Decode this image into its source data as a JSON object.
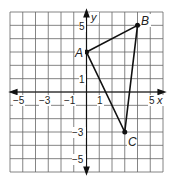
{
  "chart_data": {
    "type": "scatter",
    "title": "",
    "xlabel": "x",
    "ylabel": "y",
    "xlim": [
      -6,
      6
    ],
    "ylim": [
      -6,
      6
    ],
    "grid": true,
    "x_tick_labels": [
      "-5",
      "-3",
      "-1",
      "1",
      "5"
    ],
    "x_tick_values": [
      -5,
      -3,
      -1,
      1,
      5
    ],
    "y_tick_labels": [
      "5",
      "1",
      "-3",
      "-5"
    ],
    "y_tick_values": [
      5,
      1,
      -3,
      -5
    ],
    "points": [
      {
        "label": "A",
        "x": 0,
        "y": 3
      },
      {
        "label": "B",
        "x": 4,
        "y": 5
      },
      {
        "label": "C",
        "x": 3,
        "y": -3
      }
    ],
    "polygon": [
      "A",
      "B",
      "C"
    ],
    "shape": "triangle"
  },
  "labels": {
    "x_axis": "x",
    "y_axis": "y",
    "xt_m5": "−5",
    "xt_m3": "−3",
    "xt_m1": "−1",
    "xt_1": "1",
    "xt_5": "5",
    "yt_5": "5",
    "yt_1": "1",
    "yt_m3": "−3",
    "yt_m5": "−5",
    "A": "A",
    "B": "B",
    "C": "C"
  },
  "colors": {
    "grid": "#555555",
    "axis": "#111111",
    "triangle": "#111111"
  }
}
